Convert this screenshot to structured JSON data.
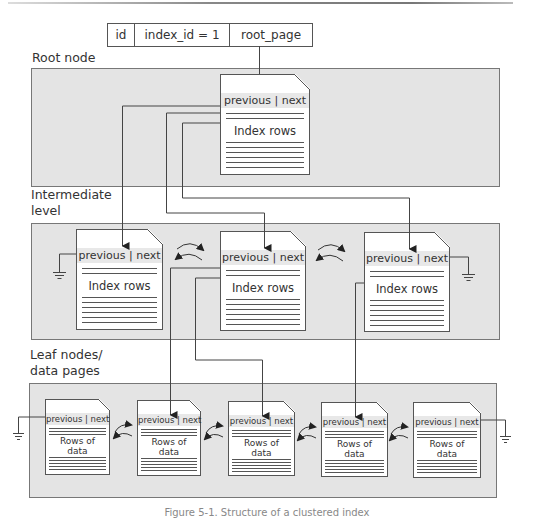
{
  "sys_table": {
    "cells": [
      "id",
      "index_id = 1",
      "root_page"
    ]
  },
  "levels": {
    "root": {
      "label": "Root node",
      "pages": [
        {
          "header": "previous | next",
          "body": "Index rows"
        }
      ]
    },
    "intermediate": {
      "label_line1": "Intermediate",
      "label_line2": "level",
      "pages": [
        {
          "header": "previous | next",
          "body": "Index rows"
        },
        {
          "header": "previous | next",
          "body": "Index rows"
        },
        {
          "header": "previous | next",
          "body": "Index rows"
        }
      ]
    },
    "leaf": {
      "label_line1": "Leaf nodes/",
      "label_line2": "data pages",
      "pages": [
        {
          "header": "previous | next",
          "body_line1": "Rows of",
          "body_line2": "data"
        },
        {
          "header": "previous | next",
          "body_line1": "Rows of",
          "body_line2": "data"
        },
        {
          "header": "previous | next",
          "body_line1": "Rows of",
          "body_line2": "data"
        },
        {
          "header": "previous | next",
          "body_line1": "Rows of",
          "body_line2": "data"
        },
        {
          "header": "previous | next",
          "body_line1": "Rows of",
          "body_line2": "data"
        }
      ]
    }
  },
  "icons": {
    "null_pointer": "ground-symbol",
    "sibling_link": "double-curved-arrow"
  },
  "colors": {
    "panel_bg": "#e4e4e4",
    "panel_border": "#777777",
    "page_bg": "#ffffff",
    "line": "#444444"
  },
  "caption": "Figure 5-1. Structure of a clustered index"
}
